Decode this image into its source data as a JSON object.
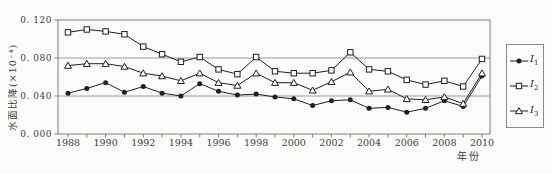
{
  "figure": {
    "background": "#fbfbf9",
    "series_color": "#1f1f1f",
    "frame_color": "#7f7f7b",
    "grid_color": "#9c9c98",
    "text_color": "#3c3c3c"
  },
  "chart_data": {
    "type": "line",
    "title": "",
    "xlabel": "年份",
    "ylabel": "水面比降(×10⁻⁴)",
    "grid": "horizontal",
    "legend_position": "right-outside",
    "ylim": [
      0,
      0.12
    ],
    "yticks": [
      0,
      0.04,
      0.08,
      0.12
    ],
    "ytick_labels": [
      "0. 000",
      "0. 040",
      "0. 080",
      "0. 120"
    ],
    "xtick_step": 2,
    "x": [
      1988,
      1989,
      1990,
      1991,
      1992,
      1993,
      1994,
      1995,
      1996,
      1997,
      1998,
      1999,
      2000,
      2001,
      2002,
      2003,
      2004,
      2005,
      2006,
      2007,
      2008,
      2009,
      2010
    ],
    "series": [
      {
        "name": "I1",
        "label_main": "I",
        "label_sub": "1",
        "marker": "filled-circle",
        "values": [
          0.043,
          0.048,
          0.054,
          0.044,
          0.05,
          0.043,
          0.04,
          0.053,
          0.045,
          0.041,
          0.042,
          0.039,
          0.037,
          0.03,
          0.035,
          0.036,
          0.027,
          0.028,
          0.023,
          0.027,
          0.035,
          0.029,
          0.061
        ]
      },
      {
        "name": "I2",
        "label_main": "I",
        "label_sub": "2",
        "marker": "open-square",
        "values": [
          0.107,
          0.11,
          0.108,
          0.105,
          0.092,
          0.084,
          0.076,
          0.081,
          0.068,
          0.063,
          0.081,
          0.066,
          0.064,
          0.064,
          0.067,
          0.086,
          0.068,
          0.066,
          0.057,
          0.052,
          0.056,
          0.05,
          0.079
        ]
      },
      {
        "name": "I3",
        "label_main": "I",
        "label_sub": "3",
        "marker": "open-triangle",
        "values": [
          0.072,
          0.074,
          0.074,
          0.071,
          0.064,
          0.061,
          0.056,
          0.064,
          0.054,
          0.051,
          0.064,
          0.054,
          0.054,
          0.046,
          0.055,
          0.065,
          0.045,
          0.047,
          0.037,
          0.036,
          0.039,
          0.032,
          0.064
        ]
      }
    ]
  }
}
